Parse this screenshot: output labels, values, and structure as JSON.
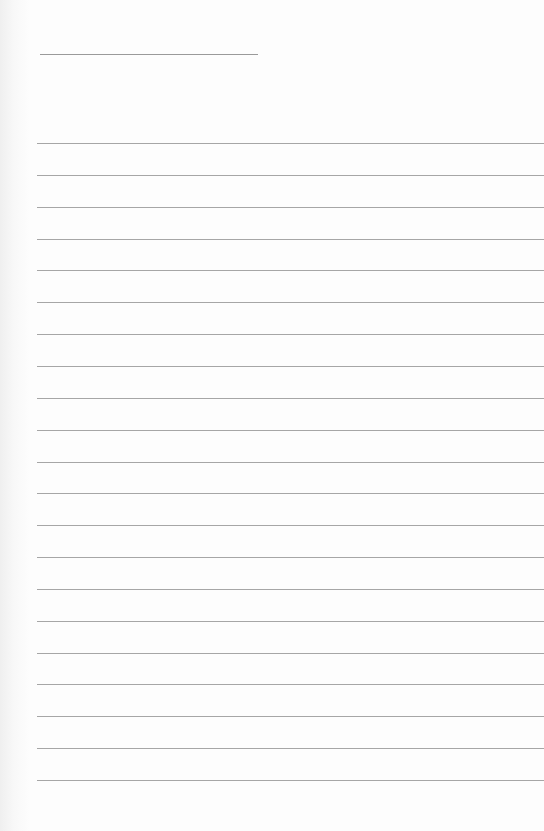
{
  "document": {
    "type": "lined-paper",
    "name_line": {
      "x": 40,
      "y": 54,
      "width": 218
    },
    "rules": {
      "count": 21,
      "first_y": 143,
      "spacing": 31.85,
      "left": 37
    },
    "line_color": "#a6a6a6",
    "paper_color": "#fdfdfd"
  }
}
